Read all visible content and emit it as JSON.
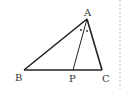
{
  "diagram": {
    "type": "geometry-triangle",
    "points": {
      "A": {
        "label": "A",
        "x": 87,
        "y": 19
      },
      "B": {
        "label": "B",
        "x": 24,
        "y": 70
      },
      "C": {
        "label": "C",
        "x": 102,
        "y": 70
      },
      "P": {
        "label": "P",
        "x": 73,
        "y": 70
      }
    },
    "segments": [
      "AB",
      "BC",
      "CA",
      "AP"
    ],
    "angle_marks": "equal angles BAP and PAC (dots)",
    "colors": {
      "stroke": "#222222",
      "dash": "#bbbbbb"
    }
  }
}
